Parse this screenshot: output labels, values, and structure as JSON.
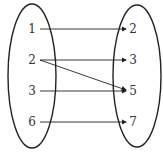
{
  "diagram": {
    "type": "mapping",
    "domain_set": [
      "1",
      "2",
      "3",
      "6"
    ],
    "codomain_set": [
      "2",
      "3",
      "5",
      "7"
    ],
    "arrows": [
      {
        "from": "1",
        "to": "2"
      },
      {
        "from": "2",
        "to": "3"
      },
      {
        "from": "2",
        "to": "5"
      },
      {
        "from": "3",
        "to": "5"
      },
      {
        "from": "6",
        "to": "7"
      }
    ],
    "colors": {
      "stroke": "#222222",
      "text": "#333333",
      "background": "#ffffff"
    }
  }
}
